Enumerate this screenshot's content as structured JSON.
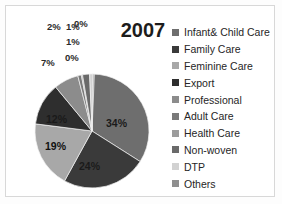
{
  "chart_data": {
    "type": "pie",
    "title": "2007",
    "xlabel": "",
    "ylabel": "",
    "legend_position": "right",
    "grid": false,
    "categories": [
      "Infant& Child Care",
      "Family Care",
      "Feminine Care",
      "Export",
      "Professional",
      "Adult Care",
      "Health Care",
      "Non-woven",
      "DTP",
      "Others"
    ],
    "values": [
      34,
      24,
      19,
      12,
      7,
      1,
      0,
      2,
      1,
      0
    ],
    "value_labels": [
      "34%",
      "24%",
      "19%",
      "12%",
      "7%",
      "1%",
      "0%",
      "2%",
      "1%",
      "0%"
    ],
    "colors": [
      "#6e6e6e",
      "#3a3a3a",
      "#a8a8a8",
      "#2e2e2e",
      "#8c8c8c",
      "#7a7a7a",
      "#9c9c9c",
      "#6a6a6a",
      "#d2d2d2",
      "#8f8f8f"
    ]
  },
  "chart": {
    "title": "2007"
  },
  "labels": {
    "slice_34": "34%",
    "slice_24": "24%",
    "slice_19": "19%",
    "slice_12": "12%",
    "slice_7": "7%",
    "slice_2": "2%",
    "slice_1a": "1%",
    "slice_0a": "0%",
    "slice_1b": "1%",
    "slice_0b": "0%"
  },
  "legend": {
    "items": [
      {
        "label": "Infant& Child Care",
        "color": "#6e6e6e"
      },
      {
        "label": "Family Care",
        "color": "#3a3a3a"
      },
      {
        "label": "Feminine Care",
        "color": "#a8a8a8"
      },
      {
        "label": "Export",
        "color": "#2e2e2e"
      },
      {
        "label": "Professional",
        "color": "#8c8c8c"
      },
      {
        "label": "Adult Care",
        "color": "#7a7a7a"
      },
      {
        "label": "Health Care",
        "color": "#9c9c9c"
      },
      {
        "label": "Non-woven",
        "color": "#6a6a6a"
      },
      {
        "label": "DTP",
        "color": "#d2d2d2"
      },
      {
        "label": "Others",
        "color": "#8f8f8f"
      }
    ]
  }
}
